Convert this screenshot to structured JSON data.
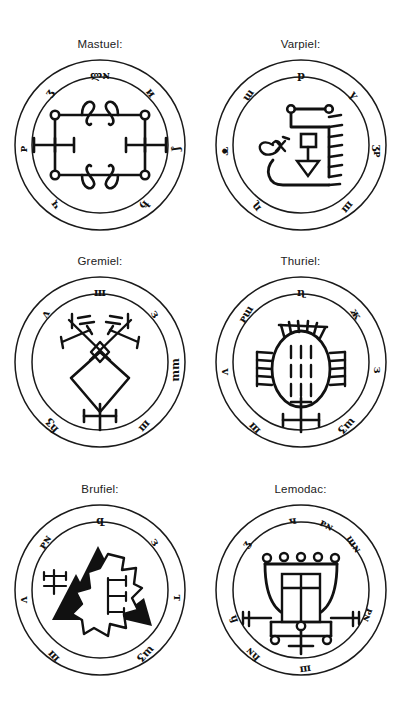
{
  "page": {
    "background_color": "#ffffff",
    "ink_color": "#1a1a1a",
    "width": 401,
    "height": 713,
    "layout": {
      "columns": 2,
      "rows": 3
    }
  },
  "seals": [
    {
      "id": "mastuel",
      "label": "Mastuel:",
      "design": "square-with-corner-circles-curls-and-side-crosses",
      "ring_glyphs": [
        "ლɴ",
        "и",
        "ʒ",
        "ᴩ",
        "ʆ",
        "ђ",
        "ҷ"
      ],
      "glyph_count": 7
    },
    {
      "id": "varpiel",
      "label": "Varpiel:",
      "design": "bracket-with-ladder-rungs-square-and-downward-triangle",
      "ring_glyphs": [
        "р",
        "ү",
        "ɯ",
        "ᴥ",
        "ʒᴩ",
        "ɳ",
        "ш"
      ],
      "glyph_count": 7
    },
    {
      "id": "gremiel",
      "label": "Gremiel:",
      "design": "rhombus-with-crossed-diagonals-and-base-cross",
      "ring_glyphs": [
        "ш",
        "з",
        "ɯɯ",
        "ʌ",
        "ɦʒ",
        "ш"
      ],
      "glyph_count": 6
    },
    {
      "id": "thuriel",
      "design": "oval-with-comb-teeth-tally-marks-and-base-cross",
      "label": "Thuriel:",
      "ring_glyphs": [
        "ɳ",
        "ж",
        "з",
        "ᴩɯ",
        "ʌ",
        "ɯʒ",
        "ш"
      ],
      "glyph_count": 7
    },
    {
      "id": "brufiel",
      "label": "Brufiel:",
      "design": "black-triangles-with-white-stepped-polygon-and-crosses",
      "ring_glyphs": [
        "զ",
        "з",
        "т",
        "ᴩɴ",
        "ʌ",
        "ɯʒ",
        "ш"
      ],
      "glyph_count": 7
    },
    {
      "id": "lemodac",
      "label": "Lemodac:",
      "design": "cup-with-rim-circles-inner-grid-and-base-crosses",
      "ring_glyphs": [
        "ч",
        "ᴩɴ",
        "ɯɴ",
        "ʒ",
        "ᴩɴ",
        "ɦ",
        "ɦɴ",
        "ш"
      ],
      "glyph_count": 8
    }
  ]
}
